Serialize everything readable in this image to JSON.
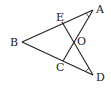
{
  "figure": {
    "type": "geometry-diagram",
    "points": {
      "A": {
        "label": "A",
        "x": 93,
        "y": 10
      },
      "E": {
        "label": "E",
        "x": 62,
        "y": 22
      },
      "B": {
        "label": "B",
        "x": 22,
        "y": 42
      },
      "O": {
        "label": "O",
        "x": 73,
        "y": 41
      },
      "C": {
        "label": "C",
        "x": 63,
        "y": 61
      },
      "D": {
        "label": "D",
        "x": 93,
        "y": 75
      }
    },
    "segments": [
      "BA",
      "BD",
      "AC",
      "ED"
    ],
    "angle_marks": [
      "A",
      "D"
    ],
    "line_color": "#222222"
  }
}
